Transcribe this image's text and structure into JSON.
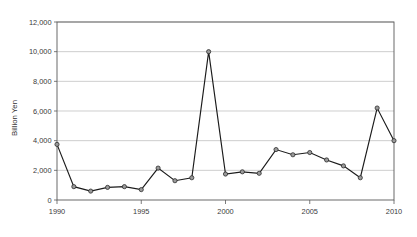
{
  "chart_data": {
    "type": "line",
    "title": "",
    "xlabel": "",
    "ylabel": "Billion Yen",
    "ylim": [
      0,
      12000
    ],
    "xlim": [
      1990,
      2010
    ],
    "grid": true,
    "legend": false,
    "y_ticks": [
      0,
      2000,
      4000,
      6000,
      8000,
      10000,
      12000
    ],
    "y_tick_labels": [
      "0",
      "2,000",
      "4,000",
      "6,000",
      "8,000",
      "10,000",
      "12,000"
    ],
    "x_ticks": [
      1990,
      1995,
      2000,
      2005,
      2010
    ],
    "x_tick_labels": [
      "1990",
      "1995",
      "2000",
      "2005",
      "2010"
    ],
    "marker": "circle",
    "marker_face_color": "#9a9a9a",
    "marker_edge_color": "#242424",
    "line_color": "#1b1b1b",
    "grid_color": "#b9b9b9",
    "x": [
      1990,
      1991,
      1992,
      1993,
      1994,
      1995,
      1996,
      1997,
      1998,
      1999,
      2000,
      2001,
      2002,
      2003,
      2004,
      2005,
      2006,
      2007,
      2008,
      2009,
      2010
    ],
    "values": [
      3750,
      900,
      600,
      850,
      900,
      700,
      2150,
      1300,
      1500,
      10000,
      1750,
      1900,
      1800,
      3400,
      3050,
      3200,
      2700,
      2300,
      1500,
      6200,
      4000
    ],
    "categories": [
      "1990",
      "1991",
      "1992",
      "1993",
      "1994",
      "1995",
      "1996",
      "1997",
      "1998",
      "1999",
      "2000",
      "2001",
      "2002",
      "2003",
      "2004",
      "2005",
      "2006",
      "2007",
      "2008",
      "2009",
      "2010"
    ],
    "series": [
      {
        "name": "",
        "values": [
          3750,
          900,
          600,
          850,
          900,
          700,
          2150,
          1300,
          1500,
          10000,
          1750,
          1900,
          1800,
          3400,
          3050,
          3200,
          2700,
          2300,
          1500,
          6200,
          4000
        ]
      }
    ],
    "annotations": []
  }
}
